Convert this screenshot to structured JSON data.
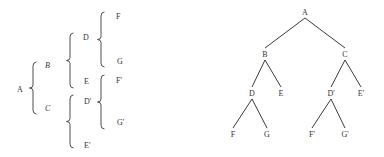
{
  "bracket_diagram": {
    "root": "A",
    "nodes": [
      {
        "id": "A",
        "label": "A",
        "italic": false
      },
      {
        "id": "B",
        "label": "B",
        "italic": true
      },
      {
        "id": "C",
        "label": "C",
        "italic": true
      },
      {
        "id": "D",
        "label": "D",
        "italic": false
      },
      {
        "id": "E",
        "label": "E",
        "italic": false
      },
      {
        "id": "F",
        "label": "F",
        "italic": false
      },
      {
        "id": "G",
        "label": "G",
        "italic": false
      },
      {
        "id": "D2",
        "label": "D'",
        "italic": false
      },
      {
        "id": "E2",
        "label": "E'",
        "italic": false
      },
      {
        "id": "F2",
        "label": "F'",
        "italic": false
      },
      {
        "id": "G2",
        "label": "G'",
        "italic": false
      }
    ],
    "groups": [
      {
        "parent": "A",
        "children": [
          "B",
          "C"
        ]
      },
      {
        "parent": "B",
        "children": [
          "D",
          "E"
        ]
      },
      {
        "parent": "D",
        "children": [
          "F",
          "G"
        ]
      },
      {
        "parent": "C",
        "children": [
          "D2",
          "E2"
        ]
      },
      {
        "parent": "D2",
        "children": [
          "F2",
          "G2"
        ]
      }
    ]
  },
  "tree_diagram": {
    "root": "A",
    "nodes": [
      {
        "id": "A",
        "label": "A"
      },
      {
        "id": "B",
        "label": "B"
      },
      {
        "id": "C",
        "label": "C"
      },
      {
        "id": "D",
        "label": "D"
      },
      {
        "id": "E",
        "label": "E"
      },
      {
        "id": "D2",
        "label": "D'"
      },
      {
        "id": "E2",
        "label": "E'"
      },
      {
        "id": "F",
        "label": "F"
      },
      {
        "id": "G",
        "label": "G"
      },
      {
        "id": "F2",
        "label": "F'"
      },
      {
        "id": "G2",
        "label": "G'"
      }
    ],
    "edges": [
      [
        "A",
        "B"
      ],
      [
        "A",
        "C"
      ],
      [
        "B",
        "D"
      ],
      [
        "B",
        "E"
      ],
      [
        "C",
        "D2"
      ],
      [
        "C",
        "E2"
      ],
      [
        "D",
        "F"
      ],
      [
        "D",
        "G"
      ],
      [
        "D2",
        "F2"
      ],
      [
        "D2",
        "G2"
      ]
    ]
  }
}
